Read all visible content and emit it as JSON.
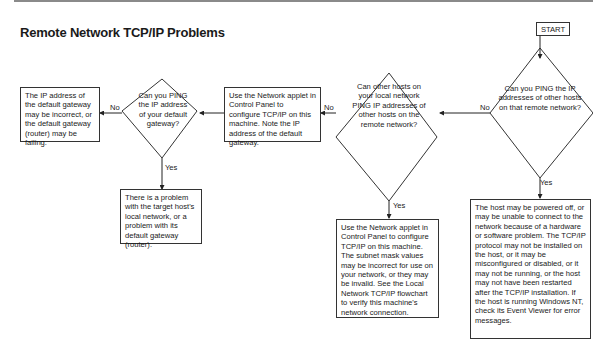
{
  "title": "Remote Network TCP/IP Problems",
  "start": "START",
  "decisions": [
    {
      "id": "d1",
      "text": "Can you PING the IP addresses of other hosts on that remote network?"
    },
    {
      "id": "d2",
      "text": "Can other hosts on your local network PING IP addresses of other hosts on the remote network?"
    },
    {
      "id": "d3",
      "text": "Can you PING the IP address of your default gateway?"
    }
  ],
  "boxes": [
    {
      "id": "b_host",
      "text": "The host may be powered off, or may be unable to connect to the network because of a hardware or software problem. The TCP/IP protocol may not be installed on the host, or it may be misconfigured or disabled, or it may not be running, or the host may not have been restarted after the TCP/IP installation. If the host is running Windows NT, check its Event Viewer for error messages."
    },
    {
      "id": "b_subnet",
      "text": "Use the Network applet in Control Panel to configure TCP/IP on this machine. The subnet mask values may be incorrect for use on your network, or they may be invalid.  See the Local Network TCP/IP flowchart to verify this machine's network connection."
    },
    {
      "id": "b_config",
      "text": "Use the Network applet in Control Panel to configure TCP/IP on this machine. Note the IP address of the default gateway."
    },
    {
      "id": "b_gateway",
      "text": "The IP address of the default gateway may be incorrect, or the default gateway (router) may be failing."
    },
    {
      "id": "b_local",
      "text": "There is a problem with the target host's local network, or a problem with its default gateway (router)."
    }
  ],
  "labels": {
    "yes": "Yes",
    "no": "No"
  }
}
